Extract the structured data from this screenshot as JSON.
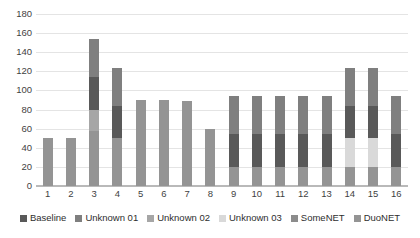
{
  "chart_data": {
    "type": "bar",
    "subtype": "stacked-bar",
    "title": "",
    "xlabel": "",
    "ylabel": "",
    "ylim": [
      0,
      180
    ],
    "ytick_step": 20,
    "yticks": [
      0,
      20,
      40,
      60,
      80,
      100,
      120,
      140,
      160,
      180
    ],
    "grid": true,
    "legend_position": "bottom",
    "categories": [
      "1",
      "2",
      "3",
      "4",
      "5",
      "6",
      "7",
      "8",
      "9",
      "10",
      "11",
      "12",
      "13",
      "14",
      "15",
      "16"
    ],
    "series": [
      {
        "name": "Baseline",
        "color": "#595959",
        "values": [
          0,
          0,
          34,
          34,
          0,
          0,
          0,
          0,
          34,
          34,
          34,
          34,
          34,
          34,
          34,
          34
        ]
      },
      {
        "name": "Unknown 01",
        "color": "#7f7f7f",
        "values": [
          0,
          0,
          40,
          40,
          0,
          0,
          0,
          0,
          40,
          40,
          40,
          40,
          40,
          40,
          40,
          40
        ]
      },
      {
        "name": "Unknown 02",
        "color": "#a6a6a6",
        "values": [
          0,
          0,
          22,
          0,
          0,
          0,
          0,
          0,
          0,
          0,
          0,
          0,
          0,
          0,
          0,
          0
        ]
      },
      {
        "name": "Unknown 03",
        "color": "#d9d9d9",
        "values": [
          0,
          0,
          0,
          0,
          0,
          0,
          0,
          0,
          0,
          0,
          0,
          0,
          0,
          30,
          30,
          0
        ]
      },
      {
        "name": "SomeNET",
        "color": "#8c8c8c",
        "values": [
          0,
          0,
          0,
          0,
          0,
          0,
          0,
          0,
          0,
          0,
          0,
          0,
          0,
          0,
          0,
          0
        ]
      },
      {
        "name": "DuoNET",
        "color": "#949494",
        "values": [
          50,
          50,
          58,
          50,
          90,
          90,
          89,
          60,
          20,
          20,
          20,
          20,
          20,
          20,
          20,
          20
        ]
      }
    ],
    "totals": [
      50,
      50,
      154,
      124,
      90,
      90,
      89,
      60,
      94,
      94,
      94,
      94,
      94,
      124,
      124,
      94
    ]
  },
  "legend": {
    "items": [
      {
        "label": "Baseline",
        "color": "#595959"
      },
      {
        "label": "Unknown 01",
        "color": "#7f7f7f"
      },
      {
        "label": "Unknown 02",
        "color": "#a6a6a6"
      },
      {
        "label": "Unknown 03",
        "color": "#d9d9d9"
      },
      {
        "label": "SomeNET",
        "color": "#8c8c8c"
      },
      {
        "label": "DuoNET",
        "color": "#949494"
      }
    ]
  },
  "axes": {
    "y_ticks": [
      "180",
      "160",
      "140",
      "120",
      "100",
      "80",
      "60",
      "40",
      "20",
      "0"
    ],
    "x_ticks": [
      "1",
      "2",
      "3",
      "4",
      "5",
      "6",
      "7",
      "8",
      "9",
      "10",
      "11",
      "12",
      "13",
      "14",
      "15",
      "16"
    ]
  }
}
